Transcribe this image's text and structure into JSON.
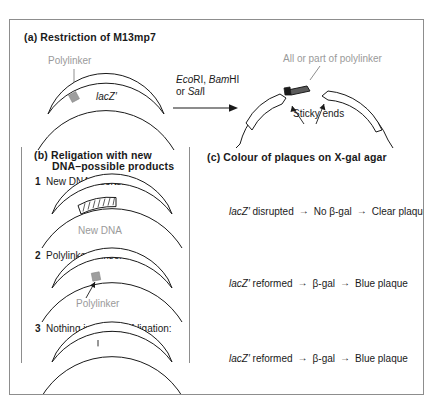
{
  "figure": {
    "panel_a": {
      "title": "(a)  Restriction of M13mp7",
      "polylinker_label": "Polylinker",
      "gene_label": "lacZ′",
      "enzymes_line1_parts": [
        "Eco",
        "RI, ",
        "Bam",
        "HI"
      ],
      "enzymes_line1": "EcoRI, BamHI",
      "enzymes_line2": "or SalI",
      "enzymes_line2_prefix": "or ",
      "enzymes_line2_italic": "Sal",
      "enzymes_line2_suffix": "I",
      "fragment_label": "All or part of polylinker",
      "sticky_ends_label": "Sticky ends"
    },
    "panel_b": {
      "title_line1": "(b)  Religation with new",
      "title_line2": "DNA–possible products",
      "items": [
        {
          "number": "1",
          "label": "New DNA inserts:",
          "annotation": "New DNA"
        },
        {
          "number": "2",
          "label": "Polylinker reinserts:",
          "annotation": "Polylinker"
        },
        {
          "number": "3",
          "label": "Nothing inserts–self-ligation:",
          "annotation": ""
        }
      ]
    },
    "panel_c": {
      "title": "(c)  Colour of plaques on X-gal agar",
      "rows": [
        {
          "gene": "lacZ′",
          "state": " disrupted",
          "arrow": "→",
          "middle": "No β-gal",
          "arrow2": "→",
          "result": "Clear plaque"
        },
        {
          "gene": "lacZ′",
          "state": " reformed",
          "arrow": "→",
          "middle": "β-gal",
          "arrow2": "→",
          "result": "Blue plaque"
        },
        {
          "gene": "lacZ′",
          "state": " reformed",
          "arrow": "→",
          "middle": "β-gal",
          "arrow2": "→",
          "result": "Blue plaque"
        }
      ]
    },
    "colors": {
      "stroke": "#1a1a1a",
      "gray_label": "#9a9a9a",
      "polylinker_fill": "#9e9e9e",
      "frame": "#8d8d8d",
      "background": "#ffffff"
    }
  }
}
